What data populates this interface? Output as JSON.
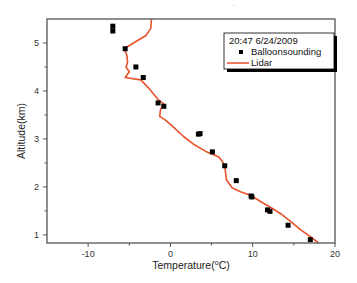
{
  "chart_data": {
    "type": "scatter",
    "title": "",
    "xlabel": "Temperature(°C)",
    "xlabel_parts": {
      "prefix": "Temperature(",
      "sup": "o",
      "suffix": "C)"
    },
    "ylabel": "Altitude(km)",
    "xlim": [
      -15,
      20
    ],
    "ylim": [
      0.83,
      5.5
    ],
    "x_ticks": [
      -10,
      0,
      10,
      20
    ],
    "x_minor_ticks": [
      -5,
      5,
      15
    ],
    "y_ticks": [
      1,
      2,
      3,
      4,
      5
    ],
    "y_minor_ticks": [
      1.5,
      2.5,
      3.5,
      4.5
    ],
    "grid": false,
    "legend": {
      "position": "upper right",
      "title": "20:47 6/24/2009",
      "entries": [
        {
          "label": "Balloonsounding",
          "marker": "square",
          "color": "#000000"
        },
        {
          "label": "Lidar",
          "marker": "line",
          "color": "#e8522a"
        }
      ]
    },
    "series": [
      {
        "name": "Balloonsounding",
        "type": "scatter",
        "color": "#000000",
        "points": [
          [
            -7.0,
            5.35
          ],
          [
            -7.0,
            5.25
          ],
          [
            -5.5,
            4.88
          ],
          [
            -4.2,
            4.5
          ],
          [
            -3.3,
            4.28
          ],
          [
            -1.5,
            3.75
          ],
          [
            -0.8,
            3.68
          ],
          [
            3.4,
            3.1
          ],
          [
            3.6,
            3.11
          ],
          [
            5.1,
            2.73
          ],
          [
            6.6,
            2.44
          ],
          [
            8.0,
            2.13
          ],
          [
            9.8,
            1.81
          ],
          [
            9.9,
            1.79
          ],
          [
            11.8,
            1.52
          ],
          [
            12.1,
            1.49
          ],
          [
            14.3,
            1.2
          ],
          [
            17.0,
            0.9
          ]
        ]
      },
      {
        "name": "Lidar",
        "type": "line",
        "color": "#e8522a",
        "points": [
          [
            -2.3,
            5.5
          ],
          [
            -2.4,
            5.3
          ],
          [
            -3.0,
            5.15
          ],
          [
            -4.5,
            5.0
          ],
          [
            -5.6,
            4.88
          ],
          [
            -5.3,
            4.75
          ],
          [
            -5.2,
            4.6
          ],
          [
            -5.4,
            4.5
          ],
          [
            -5.0,
            4.4
          ],
          [
            -5.5,
            4.28
          ],
          [
            -3.6,
            4.23
          ],
          [
            -2.7,
            4.07
          ],
          [
            -1.5,
            3.82
          ],
          [
            -0.8,
            3.73
          ],
          [
            -1.2,
            3.62
          ],
          [
            -1.3,
            3.47
          ],
          [
            -0.6,
            3.39
          ],
          [
            0.4,
            3.24
          ],
          [
            1.6,
            3.05
          ],
          [
            2.8,
            2.89
          ],
          [
            4.3,
            2.74
          ],
          [
            5.9,
            2.62
          ],
          [
            6.3,
            2.53
          ],
          [
            6.6,
            2.44
          ],
          [
            6.8,
            2.15
          ],
          [
            7.5,
            1.98
          ],
          [
            8.5,
            1.9
          ],
          [
            9.8,
            1.82
          ],
          [
            11.0,
            1.69
          ],
          [
            12.2,
            1.57
          ],
          [
            13.4,
            1.44
          ],
          [
            14.6,
            1.28
          ],
          [
            15.8,
            1.11
          ],
          [
            17.1,
            0.95
          ],
          [
            18.0,
            0.83
          ]
        ]
      }
    ]
  },
  "top_mark": "."
}
